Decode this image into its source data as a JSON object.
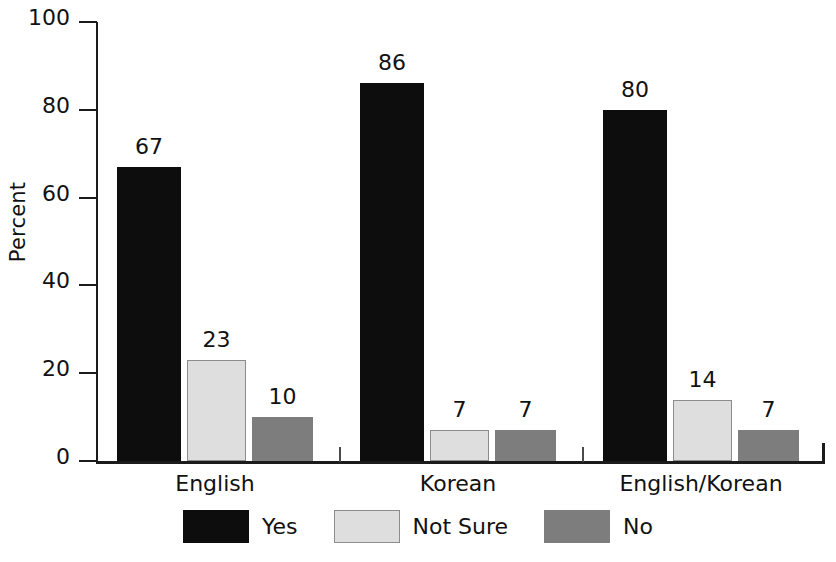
{
  "chart_data": {
    "type": "bar",
    "title": "",
    "subtitle": "",
    "xlabel": "",
    "ylabel": "Percent",
    "categories": [
      "English",
      "Korean",
      "English/Korean"
    ],
    "series": [
      {
        "name": "Yes",
        "values": [
          67,
          86,
          80
        ],
        "color": "#0d0d0d"
      },
      {
        "name": "Not Sure",
        "values": [
          23,
          7,
          14
        ],
        "color": "#dedede"
      },
      {
        "name": "No",
        "values": [
          10,
          7,
          7
        ],
        "color": "#7d7d7d"
      }
    ],
    "ylim": [
      0,
      100
    ],
    "yticks": [
      0,
      20,
      40,
      60,
      80,
      100
    ],
    "ytick_labels": [
      "0",
      "20",
      "40",
      "60",
      "80",
      "100"
    ],
    "data_labels": [
      [
        "67",
        "23",
        "10"
      ],
      [
        "86",
        "7",
        "7"
      ],
      [
        "80",
        "14",
        "7"
      ]
    ],
    "grid": false,
    "legend_position": "bottom-center",
    "legend_entries": [
      "Yes",
      "Not Sure",
      "No"
    ],
    "bar_value_labels_shown": true
  },
  "axis": {
    "y_label": "Percent",
    "y_tick_labels": [
      "100",
      "80",
      "60",
      "40",
      "20",
      "0"
    ],
    "x_tick_labels": [
      "English",
      "Korean",
      "English/Korean"
    ]
  },
  "legend": {
    "items": [
      {
        "label": "Yes",
        "swatch": "legend-swatch-yes"
      },
      {
        "label": "Not Sure",
        "swatch": "legend-swatch-not-sure"
      },
      {
        "label": "No",
        "swatch": "legend-swatch-no"
      }
    ]
  },
  "colors": {
    "yes": "#0d0d0d",
    "not_sure": "#dedede",
    "not_sure_border": "#8c8c8c",
    "no": "#7d7d7d",
    "axis": "#1b1b1b",
    "text": "#111111",
    "background": "#ffffff"
  }
}
